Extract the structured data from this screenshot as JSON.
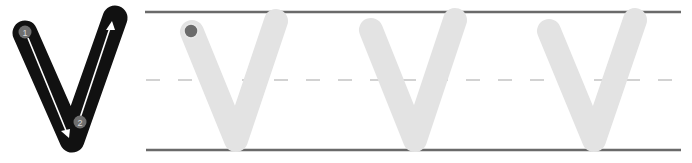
{
  "worksheet": {
    "letter": "V",
    "model": {
      "stroke_color": "#111111",
      "steps": [
        {
          "label": "1",
          "direction": "down"
        },
        {
          "label": "2",
          "direction": "up"
        }
      ],
      "step_circle_color": "#6e6e6e",
      "arrow_color": "#ffffff"
    },
    "guides": {
      "top_line_color": "#6a6a6a",
      "bottom_line_color": "#6a6a6a",
      "midline_color": "#c4c4c4",
      "midline_style": "dashed"
    },
    "tracing": {
      "count": 3,
      "stroke_color": "#e3e3e3",
      "start_dot_color": "#6b6b6b"
    }
  }
}
